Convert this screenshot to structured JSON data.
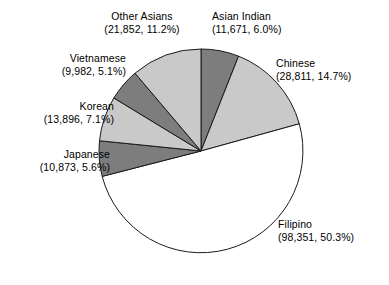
{
  "chart_data": {
    "type": "pie",
    "title": "",
    "subtitle": "",
    "xlabel": "",
    "ylabel": "",
    "legend_position": "outside-labels",
    "grid": false,
    "total": 195436,
    "start_angle_deg": 0,
    "direction": "clockwise",
    "categories": [
      "Asian Indian",
      "Chinese",
      "Filipino",
      "Japanese",
      "Korean",
      "Vietnamese",
      "Other Asians"
    ],
    "values": [
      11671,
      28811,
      98351,
      10873,
      13896,
      9982,
      21852
    ],
    "percentages": [
      6.0,
      14.7,
      50.3,
      5.6,
      7.1,
      5.1,
      11.2
    ],
    "slices": [
      {
        "name": "Asian Indian",
        "value": 11671,
        "percent": 6.0,
        "label_name": "Asian Indian",
        "label_value": "(11,671, 6.0%)",
        "color": "#7d7d7d"
      },
      {
        "name": "Chinese",
        "value": 28811,
        "percent": 14.7,
        "label_name": "Chinese",
        "label_value": "(28,811, 14.7%)",
        "color": "#c9c9c9"
      },
      {
        "name": "Filipino",
        "value": 98351,
        "percent": 50.3,
        "label_name": "Filipino",
        "label_value": "(98,351, 50.3%)",
        "color": "#ffffff"
      },
      {
        "name": "Japanese",
        "value": 10873,
        "percent": 5.6,
        "label_name": "Japanese",
        "label_value": "(10,873, 5.6%)",
        "color": "#7d7d7d"
      },
      {
        "name": "Korean",
        "value": 13896,
        "percent": 7.1,
        "label_name": "Korean",
        "label_value": "(13,896, 7.1%)",
        "color": "#c9c9c9"
      },
      {
        "name": "Vietnamese",
        "value": 9982,
        "percent": 5.1,
        "label_name": "Vietnamese",
        "label_value": "(9,982, 5.1%)",
        "color": "#7d7d7d"
      },
      {
        "name": "Other Asians",
        "value": 21852,
        "percent": 11.2,
        "label_name": "Other Asians",
        "label_value": "(21,852, 11.2%)",
        "color": "#c9c9c9"
      }
    ],
    "colors": {
      "dark_gray": "#7d7d7d",
      "light_gray": "#c9c9c9",
      "white": "#ffffff",
      "outline": "#1a1a1a",
      "background": "#ffffff",
      "text": "#000000"
    },
    "geometry": {
      "center_x": 201,
      "center_y": 151,
      "radius": 102
    }
  }
}
